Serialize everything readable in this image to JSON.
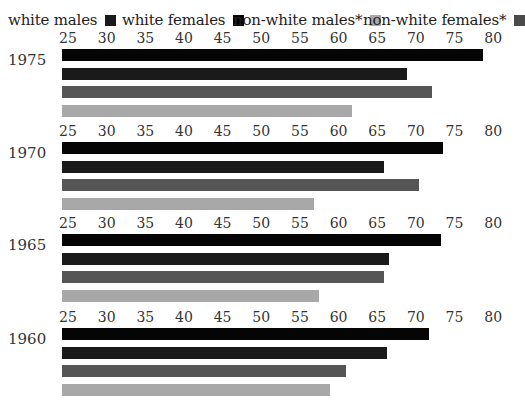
{
  "chart_data": {
    "type": "bar",
    "orientation": "horizontal",
    "title": "",
    "xlabel": "",
    "ylabel": "",
    "xlim": [
      25,
      80
    ],
    "xticks": [
      25,
      30,
      35,
      40,
      45,
      50,
      55,
      60,
      65,
      70,
      75,
      80
    ],
    "grid": false,
    "legend_position": "top",
    "categories": [
      "1975",
      "1970",
      "1965",
      "1960"
    ],
    "series": [
      {
        "name": "white males",
        "color": "#1a1a1a",
        "values": [
          68.9,
          65.9,
          66.5,
          66.3
        ]
      },
      {
        "name": "white females",
        "color": "#050505",
        "values": [
          78.7,
          73.5,
          73.3,
          71.7
        ]
      },
      {
        "name": "non-white males*",
        "color": "#a8a8a8",
        "values": [
          61.8,
          56.8,
          57.5,
          58.9
        ]
      },
      {
        "name": "non-white females*",
        "color": "#555555",
        "values": [
          72.1,
          70.4,
          65.9,
          60.9
        ]
      }
    ],
    "bar_order_within_group": [
      "white females",
      "white males",
      "non-white females*",
      "non-white males*"
    ]
  },
  "legend": [
    {
      "label": "white males",
      "color": "#1a1a1a"
    },
    {
      "label": "white females",
      "color": "#000000"
    },
    {
      "label": "non-white males*",
      "color": "#aaaaaa"
    },
    {
      "label": "non-white females*",
      "color": "#4a4a4a"
    }
  ],
  "tick_labels": [
    "25",
    "30",
    "35",
    "40",
    "45",
    "50",
    "55",
    "60",
    "65",
    "70",
    "75",
    "80"
  ]
}
